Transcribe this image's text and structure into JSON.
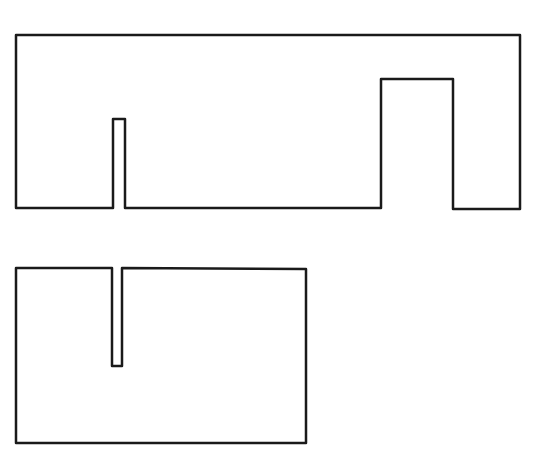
{
  "diagram": {
    "stroke_color": "#1a1a1a",
    "background_color": "#ffffff",
    "shapes": [
      {
        "name": "upper-shape",
        "points": "16,35 520,35 520,209 453,209 453,79 381,79 381,208 125,208 125,119 113,119 113,208 16,208"
      },
      {
        "name": "lower-shape",
        "points": "16,268 112,268 112,366 122,366 122,268 306,269 306,443 16,443"
      }
    ]
  }
}
